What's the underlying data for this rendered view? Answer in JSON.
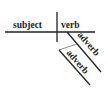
{
  "diagram": {
    "type": "sentence-diagram",
    "subject": "subject",
    "verb": "verb",
    "modifiers": [
      "adverb",
      "adverb"
    ],
    "line_color": "#222222"
  }
}
